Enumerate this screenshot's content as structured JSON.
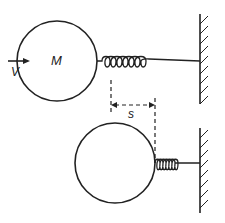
{
  "diagram": {
    "colors": {
      "stroke": "#222222",
      "background": "#ffffff"
    },
    "labels": {
      "mass": "M",
      "velocity": "V",
      "displacement": "s"
    },
    "top_state": {
      "description": "Mass M moving with velocity V toward uncompressed spring",
      "ball": {
        "cx": 57,
        "cy": 61,
        "r": 40
      },
      "spring": {
        "x1": 97,
        "x2": 200,
        "y": 61,
        "coils": 7
      },
      "wall": {
        "x": 200,
        "y1": 14,
        "y2": 104
      }
    },
    "bottom_state": {
      "description": "Mass at maximum compression of spring by distance s",
      "ball": {
        "cx": 115,
        "cy": 163,
        "r": 40
      },
      "spring": {
        "x1": 155,
        "x2": 200,
        "y": 163,
        "coils": 7
      },
      "wall": {
        "x": 200,
        "y1": 128,
        "y2": 213
      }
    },
    "dimension": {
      "from_x": 111,
      "to_x": 155,
      "y": 105,
      "label": "s"
    }
  }
}
